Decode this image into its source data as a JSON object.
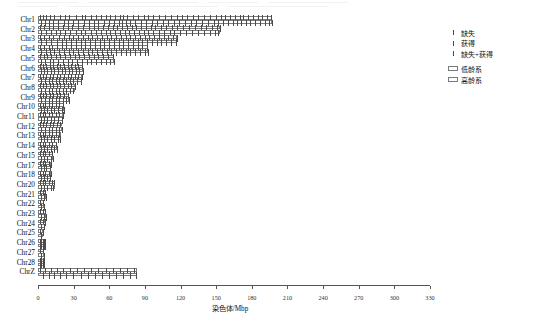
{
  "axis": {
    "xlabel": "染色体/Mbp",
    "xticks": [
      0,
      30,
      60,
      90,
      120,
      150,
      180,
      210,
      240,
      270,
      300,
      330
    ],
    "xmin": 0,
    "xmax": 330
  },
  "legend": {
    "marks": [
      {
        "name": "loss",
        "label": "缺失"
      },
      {
        "name": "gain",
        "label": "获得"
      },
      {
        "name": "loss-gain",
        "label": "缺失+获得"
      }
    ],
    "boxes": [
      {
        "name": "low-age-line",
        "label": "低龄系"
      },
      {
        "name": "high-age-line",
        "label": "高龄系"
      }
    ]
  },
  "colors": {
    "bar_border": "#7a7a7a",
    "mark": "#4a4a4a",
    "axis": "#555555",
    "text": "#111111",
    "background": "#ffffff"
  },
  "chart_data": {
    "type": "bar",
    "title": "",
    "xlabel": "染色体/Mbp",
    "ylabel": "",
    "xlim": [
      0,
      330
    ],
    "grid": false,
    "legend_position": "right-top",
    "categories": [
      "Chr1",
      "Chr2",
      "Chr3",
      "Chr4",
      "Chr5",
      "Chr6",
      "Chr7",
      "Chr8",
      "Chr9",
      "Chr10",
      "Chr11",
      "Chr12",
      "Chr13",
      "Chr14",
      "Chr15",
      "Chr17",
      "Chr18",
      "Chr20",
      "Chr21",
      "Chr22",
      "Chr23",
      "Chr24",
      "Chr25",
      "Chr26",
      "Chr27",
      "Chr28",
      "ChrZ"
    ],
    "series": [
      {
        "name": "低龄系",
        "values": [
          197,
          153,
          117,
          93,
          64,
          38,
          37,
          31,
          26,
          22,
          21,
          20,
          19,
          16,
          13,
          11,
          11,
          14,
          7,
          5,
          7,
          6,
          4,
          6,
          5,
          5,
          83
        ]
      },
      {
        "name": "高龄系",
        "values": [
          197,
          153,
          117,
          93,
          64,
          38,
          37,
          31,
          26,
          22,
          21,
          20,
          19,
          16,
          13,
          11,
          11,
          14,
          7,
          5,
          7,
          6,
          4,
          6,
          5,
          5,
          83
        ]
      }
    ],
    "rows": [
      {
        "label": "Chr1",
        "length": 197,
        "low": [
          1,
          3,
          6,
          9,
          13,
          18,
          22,
          25,
          31,
          36,
          39,
          44,
          48,
          52,
          56,
          60,
          64,
          68,
          71,
          74,
          79,
          83,
          88,
          92,
          96,
          101,
          106,
          111,
          116,
          120,
          125,
          130,
          134,
          139,
          144,
          149,
          153,
          157,
          161,
          165,
          169,
          172,
          176,
          180,
          184,
          188,
          192,
          195
        ],
        "high": [
          2,
          5,
          8,
          12,
          16,
          21,
          24,
          29,
          33,
          38,
          42,
          46,
          50,
          55,
          59,
          63,
          67,
          70,
          73,
          77,
          81,
          86,
          90,
          95,
          99,
          104,
          109,
          114,
          118,
          123,
          128,
          132,
          137,
          142,
          147,
          151,
          155,
          159,
          163,
          167,
          170,
          174,
          178,
          182,
          186,
          190,
          194,
          196
        ]
      },
      {
        "label": "Chr2",
        "length": 153,
        "low": [
          1,
          4,
          8,
          12,
          16,
          20,
          24,
          28,
          33,
          37,
          42,
          46,
          50,
          54,
          58,
          62,
          66,
          70,
          74,
          78,
          82,
          86,
          90,
          94,
          98,
          103,
          107,
          112,
          116,
          121,
          126,
          131,
          136,
          141,
          146,
          150,
          152
        ],
        "high": [
          2,
          6,
          10,
          14,
          18,
          22,
          26,
          31,
          35,
          39,
          44,
          48,
          52,
          56,
          60,
          64,
          68,
          72,
          76,
          80,
          84,
          88,
          92,
          96,
          101,
          105,
          110,
          114,
          119,
          124,
          129,
          134,
          139,
          144,
          148,
          151
        ]
      },
      {
        "label": "Chr3",
        "length": 117,
        "low": [
          1,
          4,
          8,
          12,
          17,
          21,
          25,
          29,
          33,
          37,
          41,
          45,
          49,
          53,
          57,
          61,
          65,
          69,
          73,
          77,
          81,
          85,
          89,
          93,
          97,
          101,
          105,
          109,
          113,
          116
        ],
        "high": [
          2,
          6,
          10,
          15,
          19,
          23,
          27,
          31,
          35,
          39,
          43,
          47,
          51,
          55,
          59,
          63,
          67,
          71,
          75,
          79,
          83,
          87,
          91,
          95,
          99,
          103,
          107,
          111,
          115
        ]
      },
      {
        "label": "Chr4",
        "length": 93,
        "low": [
          1,
          4,
          8,
          11,
          15,
          19,
          23,
          27,
          31,
          35,
          39,
          43,
          47,
          51,
          55,
          59,
          63,
          67,
          71,
          75,
          79,
          83,
          87,
          91
        ],
        "high": [
          2,
          6,
          9,
          13,
          17,
          21,
          25,
          29,
          33,
          37,
          41,
          45,
          49,
          53,
          57,
          61,
          65,
          69,
          73,
          77,
          81,
          85,
          89,
          92
        ]
      },
      {
        "label": "Chr5",
        "length": 64,
        "low": [
          1,
          4,
          7,
          10,
          14,
          18,
          22,
          26,
          30,
          34,
          38,
          42,
          46,
          50,
          54,
          58,
          62
        ],
        "high": [
          2,
          5,
          9,
          12,
          16,
          20,
          24,
          28,
          32,
          36,
          40,
          44,
          48,
          52,
          56,
          60,
          63
        ]
      },
      {
        "label": "Chr6",
        "length": 38,
        "low": [
          1,
          3,
          6,
          9,
          12,
          15,
          18,
          21,
          24,
          27,
          30,
          33,
          36
        ],
        "high": [
          2,
          4,
          7,
          10,
          13,
          16,
          19,
          22,
          25,
          28,
          31,
          34,
          37
        ]
      },
      {
        "label": "Chr7",
        "length": 37,
        "low": [
          1,
          3,
          6,
          9,
          12,
          15,
          18,
          21,
          24,
          27,
          30,
          33,
          36
        ],
        "high": [
          2,
          5,
          8,
          11,
          14,
          17,
          20,
          23,
          26,
          29,
          32,
          35
        ]
      },
      {
        "label": "Chr8",
        "length": 31,
        "low": [
          1,
          3,
          6,
          9,
          12,
          15,
          18,
          21,
          24,
          27,
          30
        ],
        "high": [
          2,
          5,
          8,
          11,
          14,
          17,
          20,
          23,
          26,
          29
        ]
      },
      {
        "label": "Chr9",
        "length": 26,
        "low": [
          1,
          3,
          6,
          9,
          12,
          15,
          18,
          21,
          24
        ],
        "high": [
          2,
          5,
          8,
          11,
          14,
          17,
          20,
          23,
          25
        ]
      },
      {
        "label": "Chr10",
        "length": 22,
        "low": [
          1,
          3,
          5,
          8,
          11,
          14,
          17,
          20
        ],
        "high": [
          2,
          4,
          7,
          10,
          13,
          16,
          19,
          21
        ]
      },
      {
        "label": "Chr11",
        "length": 21,
        "low": [
          1,
          3,
          5,
          8,
          11,
          14,
          17,
          20
        ],
        "high": [
          2,
          4,
          7,
          10,
          13,
          16,
          19
        ]
      },
      {
        "label": "Chr12",
        "length": 20,
        "low": [
          1,
          3,
          6,
          9,
          12,
          15,
          18
        ],
        "high": [
          2,
          5,
          8,
          11,
          14,
          17,
          19
        ]
      },
      {
        "label": "Chr13",
        "length": 19,
        "low": [
          1,
          3,
          5,
          8,
          11,
          14,
          17
        ],
        "high": [
          2,
          4,
          7,
          10,
          13,
          16,
          18
        ]
      },
      {
        "label": "Chr14",
        "length": 16,
        "low": [
          1,
          3,
          5,
          8,
          11,
          14
        ],
        "high": [
          2,
          4,
          7,
          10,
          13,
          15
        ]
      },
      {
        "label": "Chr15",
        "length": 13,
        "low": [
          1,
          3,
          5,
          8,
          11
        ],
        "high": [
          2,
          4,
          7,
          10,
          12
        ]
      },
      {
        "label": "Chr17",
        "length": 11,
        "low": [
          1,
          3,
          5,
          8,
          10
        ],
        "high": [
          2,
          4,
          6,
          9
        ]
      },
      {
        "label": "Chr18",
        "length": 11,
        "low": [
          1,
          3,
          5,
          8,
          10
        ],
        "high": [
          2,
          4,
          7,
          9
        ]
      },
      {
        "label": "Chr20",
        "length": 14,
        "low": [
          1,
          3,
          5,
          8,
          11,
          13
        ],
        "high": [
          2,
          4,
          7,
          10,
          12
        ]
      },
      {
        "label": "Chr21",
        "length": 7,
        "low": [
          1,
          3,
          5
        ],
        "high": [
          2,
          4,
          6
        ]
      },
      {
        "label": "Chr22",
        "length": 5,
        "low": [
          1,
          3
        ],
        "high": [
          2,
          4
        ]
      },
      {
        "label": "Chr23",
        "length": 7,
        "low": [
          1,
          3,
          5
        ],
        "high": [
          2,
          4,
          6
        ]
      },
      {
        "label": "Chr24",
        "length": 6,
        "low": [
          1,
          3,
          5
        ],
        "high": [
          2,
          4
        ]
      },
      {
        "label": "Chr25",
        "length": 4,
        "low": [
          1,
          3
        ],
        "high": [
          2
        ]
      },
      {
        "label": "Chr26",
        "length": 6,
        "low": [
          1,
          2,
          3,
          4,
          5
        ],
        "high": [
          1,
          2,
          3,
          4,
          5
        ]
      },
      {
        "label": "Chr27",
        "length": 5,
        "low": [
          1,
          3
        ],
        "high": [
          2,
          4
        ]
      },
      {
        "label": "Chr28",
        "length": 5,
        "low": [
          1,
          2,
          3,
          4
        ],
        "high": [
          1,
          2,
          3,
          4
        ]
      },
      {
        "label": "ChrZ",
        "length": 83,
        "low": [
          1,
          5,
          10,
          15,
          20,
          26,
          32,
          38,
          44,
          50,
          56,
          62,
          68,
          74,
          80
        ],
        "high": [
          3,
          8,
          13,
          18,
          23,
          29,
          35,
          41,
          47,
          53,
          59,
          65,
          71,
          77,
          82
        ]
      }
    ]
  }
}
